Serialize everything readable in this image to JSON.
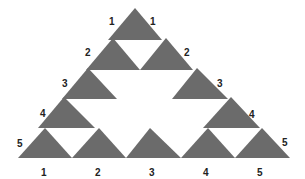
{
  "diagram": {
    "fill_color": "#6b6b6b",
    "background": "#ffffff",
    "triangles": [
      {
        "row": 1,
        "points": "135,8 108,40 162,40"
      },
      {
        "row": 2,
        "points": "113,38 86,70 140,70"
      },
      {
        "row": 2,
        "points": "166,38 140,70 193,70"
      },
      {
        "row": 3,
        "points": "88,68 62,99 117,99"
      },
      {
        "row": 3,
        "points": "197,68 172,99 228,99"
      },
      {
        "row": 4,
        "points": "64,97 38,128 95,128"
      },
      {
        "row": 4,
        "points": "231,97 203,128 260,128"
      },
      {
        "row": 5,
        "points": "45,128 18,158 72,158"
      },
      {
        "row": 5,
        "points": "99,128 72,158 126,158"
      },
      {
        "row": 5,
        "points": "150,128 126,158 181,158"
      },
      {
        "row": 5,
        "points": "208,128 181,158 235,158"
      },
      {
        "row": 5,
        "points": "262,128 235,158 290,158"
      }
    ],
    "left_labels": [
      {
        "text": "1",
        "x": 109,
        "y": 25
      },
      {
        "text": "2",
        "x": 85,
        "y": 56
      },
      {
        "text": "3",
        "x": 62,
        "y": 87
      },
      {
        "text": "4",
        "x": 40,
        "y": 117
      },
      {
        "text": "5",
        "x": 17,
        "y": 147
      }
    ],
    "right_labels": [
      {
        "text": "1",
        "x": 150,
        "y": 25
      },
      {
        "text": "2",
        "x": 184,
        "y": 56
      },
      {
        "text": "3",
        "x": 217,
        "y": 87
      },
      {
        "text": "4",
        "x": 249,
        "y": 118
      },
      {
        "text": "5",
        "x": 282,
        "y": 146
      }
    ],
    "bottom_labels": [
      {
        "text": "1",
        "x": 41,
        "y": 176
      },
      {
        "text": "2",
        "x": 95,
        "y": 176
      },
      {
        "text": "3",
        "x": 149,
        "y": 176
      },
      {
        "text": "4",
        "x": 203,
        "y": 176
      },
      {
        "text": "5",
        "x": 257,
        "y": 176
      }
    ]
  }
}
